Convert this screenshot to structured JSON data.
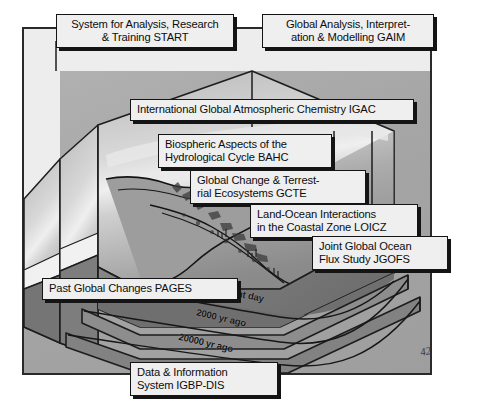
{
  "figure": {
    "page_mark": "42",
    "frame_color": "#a9a9a9",
    "label_fill": "#efefef",
    "label_border": "#141414"
  },
  "labels": {
    "start": {
      "name": "start-label",
      "text": "System for Analysis, Research\n& Training   START"
    },
    "gaim": {
      "name": "gaim-label",
      "text": "Global Analysis, Interpret-\nation & Modelling GAIM"
    },
    "igac": {
      "name": "igac-label",
      "text": "International Global Atmospheric Chemistry IGAC"
    },
    "bahc": {
      "name": "bahc-label",
      "text": "Biospheric Aspects of the\nHydrological Cycle BAHC"
    },
    "gcte": {
      "name": "gcte-label",
      "text": "Global Change & Terrest-\nrial Ecosystems GCTE"
    },
    "loicz": {
      "name": "loicz-label",
      "text": "Land-Ocean Interactions\nin the Coastal Zone LOICZ"
    },
    "jgofs": {
      "name": "jgofs-label",
      "text": "Joint Global Ocean\nFlux Study JGOFS"
    },
    "pages": {
      "name": "pages-label",
      "text": "Past Global Changes  PAGES"
    },
    "dis": {
      "name": "dis-label",
      "text": "Data & Information\nSystem IGBP-DIS"
    }
  },
  "timeline": {
    "present": "Present day",
    "t2000": "2000 yr ago",
    "t20000": "20000 yr ago"
  }
}
